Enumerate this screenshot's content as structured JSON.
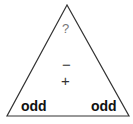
{
  "diagram": {
    "type": "triangle",
    "top": {
      "label": "?"
    },
    "operations": {
      "minus": "−",
      "plus": "+"
    },
    "bottom_left": {
      "label": "odd"
    },
    "bottom_right": {
      "label": "odd"
    },
    "stroke_color": "#333333"
  }
}
